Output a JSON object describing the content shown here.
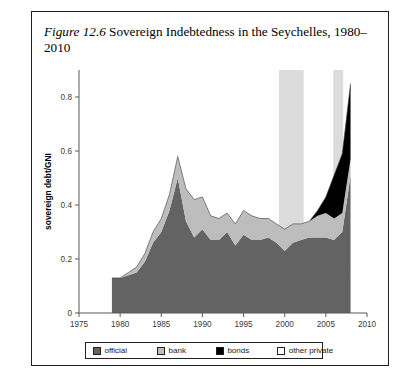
{
  "figure": {
    "label": "Figure 12.6",
    "caption": " Sovereign Indebtedness in the Seychelles, 1980–2010"
  },
  "legend": {
    "items": [
      {
        "name": "official",
        "label": "official",
        "color": "#636363"
      },
      {
        "name": "bank",
        "label": "bank",
        "color": "#bdbdbd"
      },
      {
        "name": "bonds",
        "label": "bonds",
        "color": "#000000"
      },
      {
        "name": "other-private",
        "label": "other private",
        "color": "#ffffff"
      }
    ]
  },
  "axes": {
    "y_label": "sovereign debt/GNI",
    "y_ticks": [
      "0",
      "0.2",
      "0.4",
      "0.6",
      "0.8"
    ],
    "x_ticks": [
      "1975",
      "1980",
      "1985",
      "1990",
      "1995",
      "2000",
      "2005",
      "2010"
    ]
  },
  "chart_data": {
    "type": "area",
    "title": "Sovereign Indebtedness in the Seychelles, 1980–2010",
    "xlabel": "",
    "ylabel": "sovereign debt/GNI",
    "xlim": [
      1975,
      2010
    ],
    "ylim": [
      0,
      0.9
    ],
    "grid": false,
    "legend_position": "bottom",
    "stacked": true,
    "x": [
      1979,
      1980,
      1981,
      1982,
      1983,
      1984,
      1985,
      1986,
      1987,
      1988,
      1989,
      1990,
      1991,
      1992,
      1993,
      1994,
      1995,
      1996,
      1997,
      1998,
      1999,
      2000,
      2001,
      2002,
      2003,
      2004,
      2005,
      2006,
      2007,
      2008
    ],
    "series": [
      {
        "name": "other private",
        "values": [
          0.0,
          0.0,
          0.0,
          0.0,
          0.0,
          0.0,
          0.0,
          0.0,
          0.0,
          0.0,
          0.0,
          0.0,
          0.0,
          0.0,
          0.0,
          0.0,
          0.0,
          0.0,
          0.0,
          0.0,
          0.0,
          0.0,
          0.0,
          0.0,
          0.0,
          0.0,
          0.0,
          0.0,
          0.0,
          0.0
        ]
      },
      {
        "name": "bonds",
        "values": [
          0.0,
          0.0,
          0.0,
          0.0,
          0.0,
          0.0,
          0.0,
          0.0,
          0.0,
          0.0,
          0.0,
          0.0,
          0.0,
          0.0,
          0.0,
          0.0,
          0.0,
          0.0,
          0.0,
          0.0,
          0.0,
          0.0,
          0.0,
          0.0,
          0.0,
          0.02,
          0.06,
          0.16,
          0.22,
          0.28
        ]
      },
      {
        "name": "bank",
        "values": [
          0.0,
          0.0,
          0.01,
          0.02,
          0.03,
          0.04,
          0.05,
          0.06,
          0.08,
          0.12,
          0.14,
          0.12,
          0.09,
          0.08,
          0.07,
          0.08,
          0.09,
          0.09,
          0.08,
          0.07,
          0.07,
          0.08,
          0.07,
          0.06,
          0.06,
          0.08,
          0.09,
          0.08,
          0.07,
          0.06
        ]
      },
      {
        "name": "official",
        "values": [
          0.13,
          0.13,
          0.14,
          0.15,
          0.19,
          0.26,
          0.3,
          0.38,
          0.5,
          0.34,
          0.28,
          0.31,
          0.27,
          0.27,
          0.3,
          0.25,
          0.29,
          0.27,
          0.27,
          0.28,
          0.26,
          0.23,
          0.26,
          0.27,
          0.28,
          0.28,
          0.28,
          0.27,
          0.3,
          0.51
        ]
      }
    ],
    "totals": [
      0.13,
      0.13,
      0.15,
      0.17,
      0.22,
      0.3,
      0.35,
      0.44,
      0.58,
      0.46,
      0.42,
      0.43,
      0.36,
      0.35,
      0.37,
      0.33,
      0.38,
      0.36,
      0.35,
      0.35,
      0.33,
      0.31,
      0.33,
      0.33,
      0.34,
      0.38,
      0.43,
      0.51,
      0.59,
      0.85
    ],
    "shaded_bands": [
      {
        "name": "crisis-band-1",
        "start": 1999.3,
        "end": 2002.3,
        "color": "#dcdcdc"
      },
      {
        "name": "crisis-band-2",
        "start": 2005.9,
        "end": 2007.1,
        "color": "#dcdcdc"
      }
    ]
  }
}
